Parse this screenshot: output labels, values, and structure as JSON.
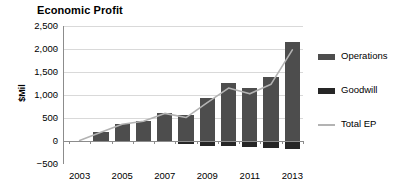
{
  "chart_data": {
    "type": "bar",
    "title": "Economic Profit",
    "xlabel": "",
    "ylabel": "$Mil",
    "ylim": [
      -500,
      2500
    ],
    "ytick_values": [
      2500,
      2000,
      1500,
      1000,
      500,
      0,
      -500
    ],
    "ytick_labels": [
      "2,500",
      "2,000",
      "1,500",
      "1,000",
      "500",
      "0",
      "−500"
    ],
    "grid": true,
    "legend_position": "right",
    "categories": [
      2003,
      2004,
      2005,
      2006,
      2007,
      2008,
      2009,
      2010,
      2011,
      2012,
      2013
    ],
    "xtick_labels": [
      "2003",
      "2005",
      "2007",
      "2009",
      "2011",
      "2013"
    ],
    "xtick_categories": [
      2003,
      2005,
      2007,
      2009,
      2011,
      2013
    ],
    "series": [
      {
        "name": "Operations",
        "color": "#4d4d4d",
        "values": [
          10,
          190,
          375,
          440,
          615,
          565,
          945,
          1265,
          1150,
          1395,
          2145
        ]
      },
      {
        "name": "Goodwill",
        "color": "#262626",
        "values": [
          0,
          0,
          -10,
          -10,
          -15,
          -55,
          -110,
          -115,
          -125,
          -160,
          -165
        ]
      },
      {
        "name": "Total EP",
        "color": "#b3b3b3",
        "type": "line",
        "values": [
          10,
          190,
          365,
          430,
          600,
          510,
          835,
          1150,
          1025,
          1235,
          1980
        ]
      }
    ]
  },
  "legend": {
    "items": [
      {
        "label": "Operations",
        "swatch": "bar",
        "color": "#4d4d4d"
      },
      {
        "label": "Goodwill",
        "swatch": "bar",
        "color": "#262626"
      },
      {
        "label": "Total EP",
        "swatch": "line",
        "color": "#b3b3b3"
      }
    ]
  }
}
